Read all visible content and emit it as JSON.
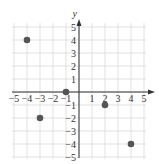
{
  "chart_data": {
    "type": "scatter",
    "title": "",
    "xlabel": "",
    "ylabel": "y",
    "xlim": [
      -5,
      5
    ],
    "ylim": [
      -5,
      5
    ],
    "grid": true,
    "x_ticks": [
      -5,
      -4,
      -3,
      -2,
      -1,
      1,
      2,
      3,
      4,
      5
    ],
    "y_ticks": [
      -5,
      -4,
      -3,
      -2,
      -1,
      1,
      2,
      3,
      4,
      5
    ],
    "x_tick_labels": [
      "−5",
      "−4",
      "−3",
      "−2",
      "−1",
      "1",
      "2",
      "3",
      "4",
      "5"
    ],
    "y_tick_labels": [
      "−5",
      "−4",
      "−3",
      "−2",
      "−1",
      "1",
      "2",
      "3",
      "4",
      "5"
    ],
    "points": [
      {
        "x": -4,
        "y": 4
      },
      {
        "x": -1,
        "y": 0
      },
      {
        "x": -3,
        "y": -2
      },
      {
        "x": 2,
        "y": -1
      },
      {
        "x": 4,
        "y": -4
      }
    ],
    "colors": {
      "grid": "#d9d9d9",
      "axis": "#333333",
      "point": "#555555"
    }
  }
}
